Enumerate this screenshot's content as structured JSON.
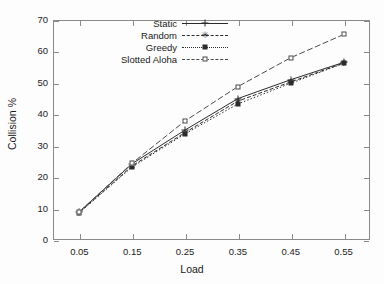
{
  "chart_data": {
    "type": "line",
    "title": "",
    "xlabel": "Load",
    "ylabel": "Collision %",
    "x": [
      0.05,
      0.15,
      0.25,
      0.35,
      0.45,
      0.55
    ],
    "xlim": [
      0.0,
      0.6
    ],
    "ylim": [
      0,
      70
    ],
    "xticks": [
      "0.05",
      "0.15",
      "0.25",
      "0.35",
      "0.45",
      "0.55"
    ],
    "yticks": [
      "0",
      "10",
      "20",
      "30",
      "40",
      "50",
      "60",
      "70"
    ],
    "grid": false,
    "legend_position": "top-center",
    "series": [
      {
        "name": "Static",
        "marker": "plus",
        "linestyle": "solid",
        "color": "#2b2b2b",
        "values": [
          9.0,
          24.3,
          35.0,
          45.0,
          51.0,
          56.5
        ]
      },
      {
        "name": "Random",
        "marker": "star",
        "linestyle": "dashed",
        "color": "#2b2b2b",
        "values": [
          8.8,
          23.6,
          34.2,
          44.2,
          50.3,
          56.3
        ]
      },
      {
        "name": "Greedy",
        "marker": "filled-square",
        "linestyle": "dotted",
        "color": "#2b2b2b",
        "values": [
          8.7,
          23.3,
          33.8,
          43.3,
          49.9,
          56.2
        ]
      },
      {
        "name": "Slotted Aloha",
        "marker": "open-square",
        "linestyle": "dash-dot",
        "color": "#4a4a4a",
        "values": [
          9.0,
          24.5,
          37.9,
          48.8,
          58.0,
          65.4
        ]
      }
    ]
  },
  "axes": {
    "x_title": "Load",
    "y_title": "Collision %"
  },
  "legend": {
    "entries": [
      {
        "label": "Static"
      },
      {
        "label": "Random"
      },
      {
        "label": "Greedy"
      },
      {
        "label": "Slotted Aloha"
      }
    ]
  }
}
